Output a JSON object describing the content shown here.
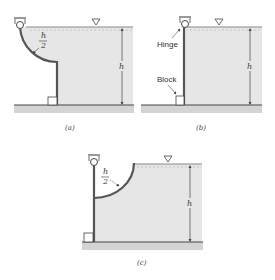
{
  "colors": {
    "water": "#e6e6e6",
    "ground": "#d4d4d4",
    "gate": "#555555",
    "line": "#444444",
    "text": "#333333"
  },
  "figures": [
    {
      "id": "a",
      "caption": "(a)",
      "gate_shape": "quarter-circle then vertical",
      "radius_label_num": "h",
      "radius_label_den": "2",
      "depth_label": "h"
    },
    {
      "id": "b",
      "caption": "(b)",
      "gate_shape": "vertical plate",
      "hinge_label": "Hinge",
      "block_label": "Block",
      "depth_label": "h"
    },
    {
      "id": "c",
      "caption": "(c)",
      "gate_shape": "vertical then concave quarter-circle",
      "radius_label_num": "h",
      "radius_label_den": "2",
      "depth_label": "h"
    }
  ]
}
